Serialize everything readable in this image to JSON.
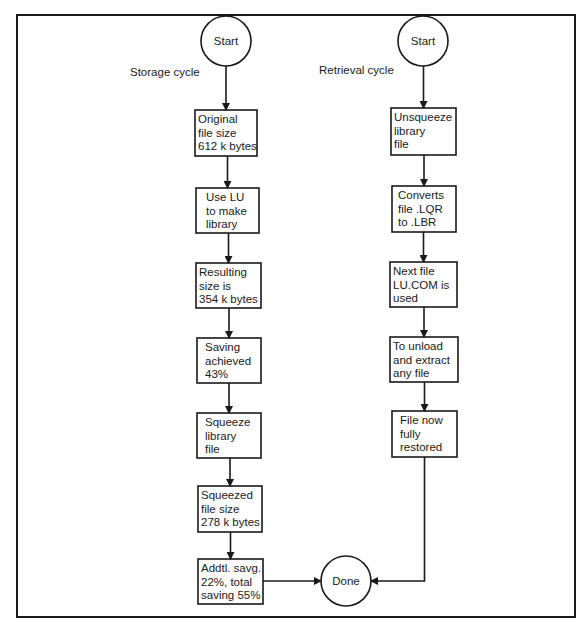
{
  "diagram": {
    "storage": {
      "label": "Storage cycle",
      "start": "Start",
      "steps": [
        [
          "Original",
          "file size",
          "612 k bytes"
        ],
        [
          "Use LU",
          "to make",
          "library"
        ],
        [
          "Resulting",
          "size is",
          "354 k bytes"
        ],
        [
          "Saving",
          "achieved",
          "43%"
        ],
        [
          "Squeeze",
          "library",
          "file"
        ],
        [
          "Squeezed",
          "file size",
          "278 k bytes"
        ],
        [
          "Addtl. savg.",
          "22%, total",
          "saving 55%"
        ]
      ]
    },
    "retrieval": {
      "label": "Retrieval cycle",
      "start": "Start",
      "steps": [
        [
          "Unsqueeze",
          "library",
          "file"
        ],
        [
          "Converts",
          "file .LQR",
          "to .LBR"
        ],
        [
          "Next file",
          "LU.COM is",
          "used"
        ],
        [
          "To unload",
          "and extract",
          "any file"
        ],
        [
          "File now",
          "fully",
          "restored"
        ]
      ]
    },
    "end": "Done"
  }
}
